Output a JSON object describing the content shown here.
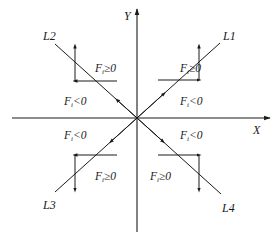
{
  "axes": {
    "x_label": "X",
    "y_label": "Y"
  },
  "lines": [
    {
      "id": "L1",
      "label": "L1",
      "quadrant": "I"
    },
    {
      "id": "L2",
      "label": "L2",
      "quadrant": "II"
    },
    {
      "id": "L3",
      "label": "L3",
      "quadrant": "III"
    },
    {
      "id": "L4",
      "label": "L4",
      "quadrant": "IV"
    }
  ],
  "regions": {
    "q1_above": {
      "F": "F",
      "sub": "i",
      "rel": "≥0"
    },
    "q1_below": {
      "F": "F",
      "sub": "i",
      "rel": "<0"
    },
    "q2_above": {
      "F": "F",
      "sub": "i",
      "rel": "≥0"
    },
    "q2_below": {
      "F": "F",
      "sub": "i",
      "rel": "<0"
    },
    "q3_above": {
      "F": "F",
      "sub": "i",
      "rel": "<0"
    },
    "q3_below": {
      "F": "F",
      "sub": "i",
      "rel": "≥0"
    },
    "q4_above": {
      "F": "F",
      "sub": "i",
      "rel": "<0"
    },
    "q4_below": {
      "F": "F",
      "sub": "i",
      "rel": "≥0"
    }
  },
  "colors": {
    "stroke": "#1a1a1a",
    "background": "#ffffff"
  }
}
